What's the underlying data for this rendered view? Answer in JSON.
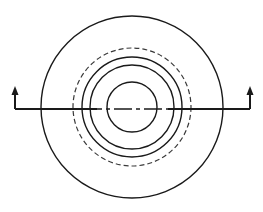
{
  "canvas": {
    "width": 263,
    "height": 212,
    "background": "#ffffff",
    "line_color": "#1a1a1a",
    "dashed_color": "#3a3a3a"
  },
  "drawing": {
    "type": "engineering-section-view",
    "title": "",
    "center": {
      "x": 132,
      "y": 107
    },
    "circles": [
      {
        "name": "outer-boundary-circle",
        "radius": 91,
        "style": "solid",
        "stroke_width": 1.4
      },
      {
        "name": "dashed-hidden-circle",
        "radius": 59,
        "style": "dashed",
        "stroke_width": 1.2,
        "dash_pattern": "5 3"
      },
      {
        "name": "outer-ring-circle",
        "radius": 50,
        "style": "solid",
        "stroke_width": 1.4
      },
      {
        "name": "inner-ring-circle",
        "radius": 42,
        "style": "solid",
        "stroke_width": 1.4
      },
      {
        "name": "bore-circle",
        "radius": 25,
        "style": "solid",
        "stroke_width": 1.4
      }
    ],
    "centerline": {
      "name": "horizontal-centerline",
      "style": "dash-dot",
      "y": 109,
      "x_start": 24,
      "x_end": 243,
      "dash_pattern": "18 4 4 4",
      "stroke_width": 1.6
    },
    "section_markers": [
      {
        "name": "section-marker-left",
        "label": "",
        "corner_x": 15,
        "corner_y": 109,
        "arm_end_x": 97,
        "arrow_tip_y": 88,
        "arrow_direction": "up"
      },
      {
        "name": "section-marker-right",
        "label": "",
        "corner_x": 250,
        "corner_y": 109,
        "arm_end_x": 168,
        "arrow_tip_y": 88,
        "arrow_direction": "up"
      }
    ]
  }
}
